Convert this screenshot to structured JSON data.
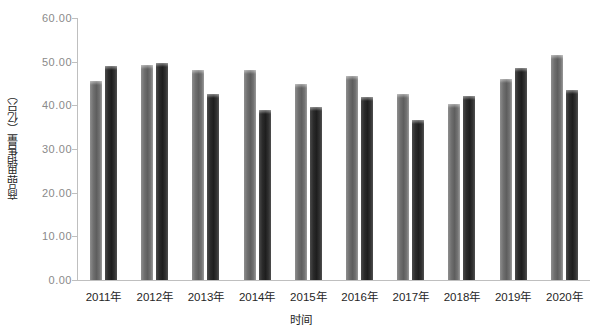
{
  "chart_data": {
    "type": "bar",
    "title": "",
    "xlabel": "时间",
    "ylabel": "商品苗销售量（亿只）",
    "categories": [
      "2011年",
      "2012年",
      "2013年",
      "2014年",
      "2015年",
      "2016年",
      "2017年",
      "2018年",
      "2019年",
      "2020年"
    ],
    "series": [
      {
        "name": "series-1",
        "color": "#6f6f6f",
        "values": [
          45.6,
          49.3,
          48.0,
          48.0,
          45.0,
          46.8,
          42.6,
          40.3,
          46.0,
          51.5
        ]
      },
      {
        "name": "series-2",
        "color": "#2b2b2b",
        "values": [
          49.0,
          49.6,
          42.7,
          39.0,
          39.7,
          42.0,
          36.6,
          42.1,
          48.6,
          43.6
        ]
      }
    ],
    "ylim": [
      0,
      60
    ],
    "yticks": [
      0,
      10,
      20,
      30,
      40,
      50,
      60
    ],
    "ytick_labels": [
      "0.00",
      "10.00",
      "20.00",
      "30.00",
      "40.00",
      "50.00",
      "60.00"
    ],
    "grid": false,
    "legend": "none",
    "axis_color": "#bfbfbf",
    "tick_label_color": "#8a8a8a"
  }
}
